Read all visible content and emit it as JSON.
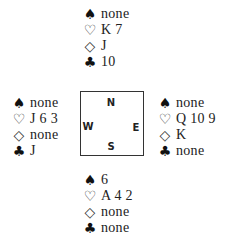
{
  "hands": {
    "north": {
      "spades": "none",
      "hearts": "K 7",
      "diamonds": "J",
      "clubs": "10"
    },
    "west": {
      "spades": "none",
      "hearts": "J 6 3",
      "diamonds": "none",
      "clubs": "J"
    },
    "east": {
      "spades": "none",
      "hearts": "Q 10 9",
      "diamonds": "K",
      "clubs": "none"
    },
    "south": {
      "spades": "6",
      "hearts": "A 4 2",
      "diamonds": "none",
      "clubs": "none"
    }
  },
  "suits": {
    "spades": "♠",
    "hearts": "♡",
    "diamonds": "◇",
    "clubs": "♣"
  },
  "compass": {
    "north": "N",
    "south": "S",
    "east": "E",
    "west": "W"
  }
}
